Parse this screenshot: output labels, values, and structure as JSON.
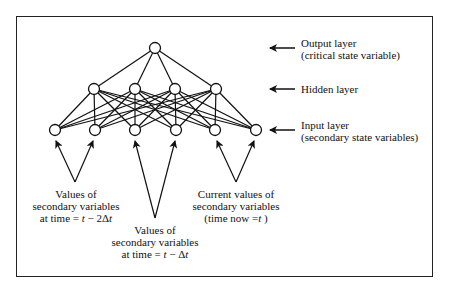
{
  "diagram": {
    "frame": {
      "x": 16,
      "y": 16,
      "width": 417,
      "height": 261
    },
    "colors": {
      "stroke": "#111111",
      "background": "#ffffff",
      "node_fill": "#ffffff"
    },
    "layers": {
      "output": {
        "nodes": [
          {
            "x": 155,
            "y": 48
          }
        ]
      },
      "hidden": {
        "nodes": [
          {
            "x": 94,
            "y": 89
          },
          {
            "x": 135,
            "y": 89
          },
          {
            "x": 175,
            "y": 89
          },
          {
            "x": 216,
            "y": 89
          }
        ]
      },
      "input": {
        "nodes": [
          {
            "x": 55,
            "y": 130
          },
          {
            "x": 95,
            "y": 130
          },
          {
            "x": 135,
            "y": 130
          },
          {
            "x": 176,
            "y": 130
          },
          {
            "x": 215,
            "y": 130
          },
          {
            "x": 256,
            "y": 130
          }
        ]
      }
    },
    "node_radius": 5.5,
    "side_labels": {
      "output_line1": "Output layer",
      "output_line2": "(critical state variable)",
      "hidden_line1": "Hidden layer",
      "input_line1": "Input layer",
      "input_line2": "(secondary state variables)"
    },
    "side_arrows": [
      {
        "name": "output-layer-arrow",
        "y": 48
      },
      {
        "name": "hidden-layer-arrow",
        "y": 89
      },
      {
        "name": "input-layer-arrow",
        "y": 130
      }
    ],
    "group_labels": {
      "t_minus_2dt": {
        "line1": "Values of",
        "line2": "secondary variables",
        "line3_prefix": "at time = ",
        "line3_var": "t",
        "line3_suffix": " − 2Δ",
        "line3_var2": "t"
      },
      "t_minus_dt": {
        "line1": "Values of",
        "line2": "secondary variables",
        "line3_prefix": "at time = ",
        "line3_var": "t",
        "line3_suffix": " − Δ",
        "line3_var2": "t"
      },
      "t_now": {
        "line1": "Current values of",
        "line2": "secondary variables",
        "line3_prefix": "(time now =",
        "line3_var": "t",
        "line3_suffix": " )"
      }
    },
    "group_arrows": [
      {
        "from": [
          75,
          182
        ],
        "to": [
          56,
          141
        ]
      },
      {
        "from": [
          75,
          182
        ],
        "to": [
          93,
          141
        ]
      },
      {
        "from": [
          155,
          218
        ],
        "to": [
          135,
          141
        ]
      },
      {
        "from": [
          155,
          218
        ],
        "to": [
          175,
          141
        ]
      },
      {
        "from": [
          236,
          182
        ],
        "to": [
          217,
          141
        ]
      },
      {
        "from": [
          236,
          182
        ],
        "to": [
          254,
          141
        ]
      }
    ]
  }
}
